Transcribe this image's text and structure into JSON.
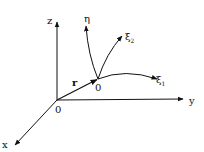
{
  "diagram": {
    "type": "coordinate-frame",
    "colors": {
      "stroke": "#111111",
      "background": "#ffffff"
    },
    "global_origin": {
      "label": "0",
      "x": 57,
      "y": 100
    },
    "axes": [
      {
        "name": "z",
        "label": "z",
        "from": [
          57,
          100
        ],
        "to": [
          57,
          22
        ],
        "label_pos": [
          47,
          24
        ]
      },
      {
        "name": "y",
        "label": "y",
        "from": [
          57,
          100
        ],
        "to": [
          183,
          99
        ],
        "label_pos": [
          189,
          104
        ]
      },
      {
        "name": "x",
        "label": "x",
        "from": [
          57,
          100
        ],
        "to": [
          15,
          145
        ],
        "label_pos": [
          2,
          148
        ]
      }
    ],
    "position_vector": {
      "label": "r",
      "from": [
        57,
        100
      ],
      "to": [
        98,
        79
      ],
      "label_pos": [
        72,
        86
      ]
    },
    "local_origin": {
      "label": "0",
      "x": 98,
      "y": 79,
      "label_pos": [
        95,
        91
      ]
    },
    "curvilinear_lines": [
      {
        "name": "eta",
        "label": "η",
        "label_pos": [
          84,
          22
        ]
      },
      {
        "name": "xi2",
        "label": "ξ",
        "subscript": "2",
        "label_pos": [
          125,
          40
        ]
      },
      {
        "name": "xi1",
        "label": "ξ",
        "subscript": "1",
        "label_pos": [
          156,
          83
        ]
      }
    ]
  }
}
